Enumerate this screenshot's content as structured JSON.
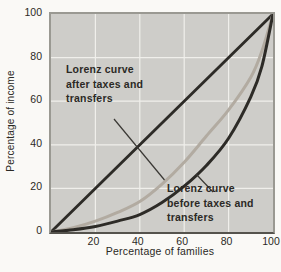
{
  "figure": {
    "y_axis_title": "Percentage of income",
    "x_axis_title": "Percentage of families",
    "y_ticks": [
      "100",
      "80",
      "60",
      "40",
      "20",
      "0"
    ],
    "x_ticks": [
      "20",
      "40",
      "60",
      "80",
      "100"
    ],
    "annotations": {
      "after": {
        "lines": [
          "Lorenz curve",
          "after taxes and",
          "transfers"
        ]
      },
      "before": {
        "lines": [
          "Lorenz curve",
          "before taxes and",
          "transfers"
        ]
      }
    },
    "colors": {
      "page_background": "#faf9f6",
      "plot_background": "#cecdc9",
      "gridline": "#f0efeb",
      "border": "#9a9992",
      "equality_line": "#2d2b27",
      "after_curve": "#b2aba1",
      "before_curve": "#2d2b27",
      "text": "#2b2925",
      "leader_line": "#3a3834"
    }
  },
  "chart_data": {
    "type": "line",
    "title": "",
    "xlabel": "Percentage of families",
    "ylabel": "Percentage of income",
    "xlim": [
      0,
      100
    ],
    "ylim": [
      0,
      100
    ],
    "x_tick_values": [
      20,
      40,
      60,
      80,
      100
    ],
    "y_tick_values": [
      0,
      20,
      40,
      60,
      80,
      100
    ],
    "grid": true,
    "legend_position": "none",
    "series": [
      {
        "name": "Line of equality",
        "color": "#2d2b27",
        "width": 2.8,
        "x": [
          0,
          100
        ],
        "y": [
          0,
          100
        ]
      },
      {
        "name": "Lorenz curve after taxes and transfers",
        "color": "#b2aba1",
        "width": 3,
        "x": [
          0,
          10,
          20,
          30,
          40,
          50,
          60,
          70,
          80,
          90,
          95,
          100
        ],
        "y": [
          0,
          2,
          5,
          9,
          14,
          22,
          32,
          44,
          56,
          71,
          83,
          100
        ]
      },
      {
        "name": "Lorenz curve before taxes and transfers",
        "color": "#2d2b27",
        "width": 3,
        "x": [
          0,
          10,
          20,
          30,
          40,
          50,
          60,
          70,
          80,
          90,
          95,
          100
        ],
        "y": [
          0,
          1,
          2.5,
          5,
          8,
          13.5,
          21,
          30.5,
          43,
          62,
          76,
          100
        ]
      }
    ]
  }
}
